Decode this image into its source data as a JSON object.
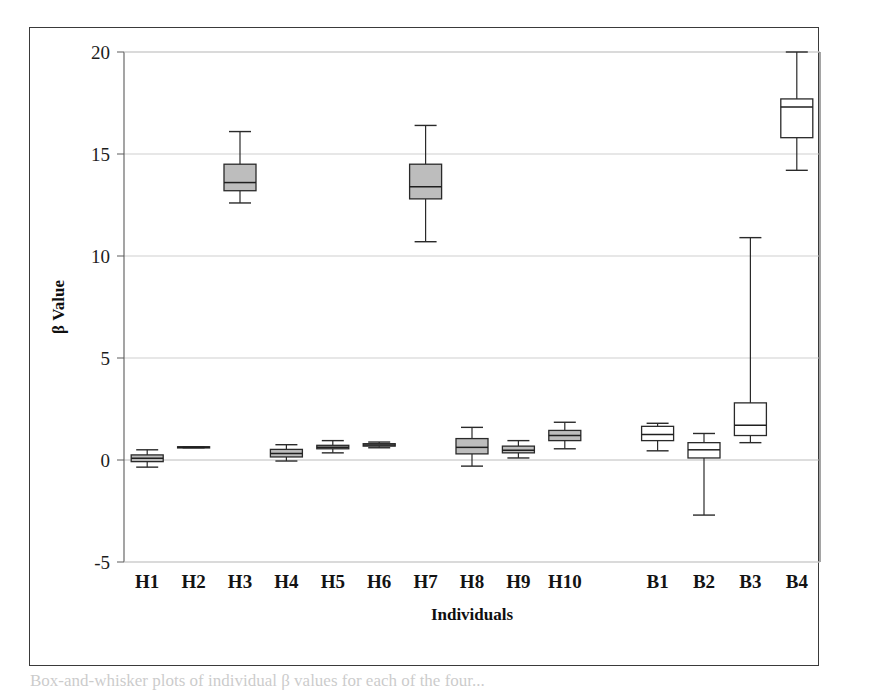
{
  "figure": {
    "background_color": "#ffffff",
    "frame_color": "#3a3a3a",
    "caption_partial": "Box-and-whisker plots of individual β values for each of the four..."
  },
  "chart_data": {
    "type": "box",
    "title": "",
    "xlabel": "Individuals",
    "ylabel": "β Value",
    "ylim": [
      -5,
      20
    ],
    "yticks": [
      -5,
      0,
      5,
      10,
      15,
      20
    ],
    "ytick_labels": [
      "-5",
      "0",
      "5",
      "10",
      "15",
      "20"
    ],
    "grid": true,
    "grid_axis": "y",
    "legend": false,
    "categories": [
      "H1",
      "H2",
      "H3",
      "H4",
      "H5",
      "H6",
      "H7",
      "H8",
      "H9",
      "H10",
      "",
      "B1",
      "B2",
      "B3",
      "B4"
    ],
    "gap_after_category": "H10",
    "box_fill_colors": {
      "H": "#bdbdbd",
      "B": "#ffffff"
    },
    "boxes": [
      {
        "label": "H1",
        "group": "H",
        "fill": "#bdbdbd",
        "whisker_low": -0.35,
        "q1": -0.08,
        "median": 0.08,
        "q3": 0.25,
        "whisker_high": 0.5
      },
      {
        "label": "H2",
        "group": "H",
        "fill": "#bdbdbd",
        "whisker_low": 0.6,
        "q1": 0.6,
        "median": 0.62,
        "q3": 0.65,
        "whisker_high": 0.65
      },
      {
        "label": "H3",
        "group": "H",
        "fill": "#bdbdbd",
        "whisker_low": 12.6,
        "q1": 13.2,
        "median": 13.6,
        "q3": 14.5,
        "whisker_high": 16.1
      },
      {
        "label": "H4",
        "group": "H",
        "fill": "#bdbdbd",
        "whisker_low": -0.05,
        "q1": 0.15,
        "median": 0.32,
        "q3": 0.52,
        "whisker_high": 0.75
      },
      {
        "label": "H5",
        "group": "H",
        "fill": "#bdbdbd",
        "whisker_low": 0.35,
        "q1": 0.55,
        "median": 0.62,
        "q3": 0.72,
        "whisker_high": 0.95
      },
      {
        "label": "H6",
        "group": "H",
        "fill": "#bdbdbd",
        "whisker_low": 0.6,
        "q1": 0.68,
        "median": 0.74,
        "q3": 0.8,
        "whisker_high": 0.88
      },
      {
        "label": "H7",
        "group": "H",
        "fill": "#bdbdbd",
        "whisker_low": 10.7,
        "q1": 12.8,
        "median": 13.4,
        "q3": 14.5,
        "whisker_high": 16.4
      },
      {
        "label": "H8",
        "group": "H",
        "fill": "#bdbdbd",
        "whisker_low": -0.3,
        "q1": 0.3,
        "median": 0.62,
        "q3": 1.05,
        "whisker_high": 1.6
      },
      {
        "label": "H9",
        "group": "H",
        "fill": "#bdbdbd",
        "whisker_low": 0.1,
        "q1": 0.35,
        "median": 0.48,
        "q3": 0.68,
        "whisker_high": 0.95
      },
      {
        "label": "H10",
        "group": "H",
        "fill": "#bdbdbd",
        "whisker_low": 0.55,
        "q1": 0.95,
        "median": 1.2,
        "q3": 1.45,
        "whisker_high": 1.85
      },
      {
        "label": "B1",
        "group": "B",
        "fill": "#ffffff",
        "whisker_low": 0.45,
        "q1": 0.95,
        "median": 1.25,
        "q3": 1.65,
        "whisker_high": 1.8
      },
      {
        "label": "B2",
        "group": "B",
        "fill": "#ffffff",
        "whisker_low": -2.7,
        "q1": 0.1,
        "median": 0.5,
        "q3": 0.85,
        "whisker_high": 1.3
      },
      {
        "label": "B3",
        "group": "B",
        "fill": "#ffffff",
        "whisker_low": 0.85,
        "q1": 1.2,
        "median": 1.7,
        "q3": 2.8,
        "whisker_high": 10.9
      },
      {
        "label": "B4",
        "group": "B",
        "fill": "#ffffff",
        "whisker_low": 14.2,
        "q1": 15.8,
        "median": 17.3,
        "q3": 17.7,
        "whisker_high": 20.0
      }
    ]
  }
}
